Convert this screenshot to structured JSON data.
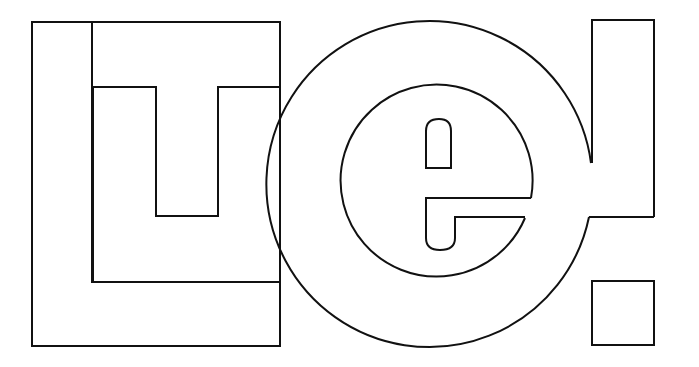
{
  "logo": {
    "title": "LTe! outline logo",
    "letters": [
      "L",
      "T",
      "e",
      "!"
    ],
    "stroke_color": "#111111",
    "background_color": "#ffffff",
    "style": "black outline, no fill"
  }
}
